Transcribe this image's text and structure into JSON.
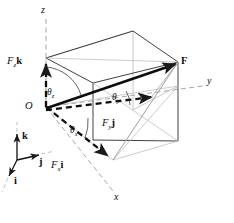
{
  "figure": {
    "type": "vector-decomposition-diagram",
    "background_color": "#ffffff",
    "line_color": "#1a1a1a",
    "faint_line_color": "#b0b0b0",
    "axes": [
      {
        "key": "z",
        "label": "z",
        "x": 41,
        "y": 9,
        "description": "vertical axis, dashed, upward"
      },
      {
        "key": "y",
        "label": "y",
        "x": 207,
        "y": 81,
        "description": "axis to the right, dashed"
      },
      {
        "key": "x",
        "label": "x",
        "x": 114,
        "y": 197,
        "description": "axis toward lower right, dashed"
      }
    ],
    "origin": {
      "label": "O",
      "x": 25,
      "y": 107
    },
    "resultant": {
      "label": "F",
      "x": 180,
      "y": 62,
      "description": "bold resultant force vector from O to far corner"
    },
    "components": [
      {
        "key": "Fz",
        "var": "F",
        "sub": "z",
        "unit": "k",
        "x": 8,
        "y": 62,
        "description": "vertical component along z"
      },
      {
        "key": "Fy",
        "var": "F",
        "sub": "y",
        "unit": "j",
        "x": 104,
        "y": 124,
        "description": "component along y"
      },
      {
        "key": "Fx",
        "var": "F",
        "sub": "x",
        "unit": "i",
        "x": 52,
        "y": 166,
        "description": "component along x"
      }
    ],
    "angles": [
      {
        "key": "theta_z",
        "symbol": "θ",
        "sub": "z",
        "x": 48,
        "y": 95,
        "description": "direction angle from z axis"
      },
      {
        "key": "theta_x",
        "symbol": "θ",
        "sub": "x",
        "x": 70,
        "y": 132,
        "description": "direction angle from x axis"
      },
      {
        "key": "theta_y",
        "symbol": "θ",
        "sub": "y",
        "x": 113,
        "y": 99,
        "description": "direction angle from y axis"
      }
    ],
    "unit_vectors": [
      {
        "key": "k",
        "label": "k",
        "x": 23,
        "y": 138,
        "description": "unit vector along z, pointing up"
      },
      {
        "key": "j",
        "label": "j",
        "x": 38,
        "y": 163,
        "description": "unit vector along y, pointing right"
      },
      {
        "key": "i",
        "label": "i",
        "x": 15,
        "y": 181,
        "description": "unit vector along x, pointing lower-left"
      }
    ]
  }
}
